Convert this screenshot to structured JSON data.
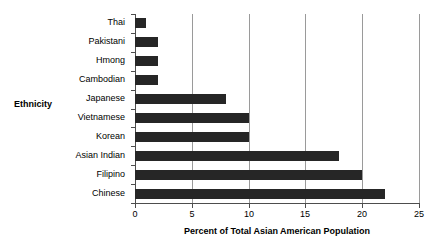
{
  "chart_data": {
    "type": "bar",
    "orientation": "horizontal",
    "title": "",
    "xlabel": "Percent of Total Asian American Population",
    "ylabel": "Ethnicity",
    "categories": [
      "Thai",
      "Pakistani",
      "Hmong",
      "Cambodian",
      "Japanese",
      "Vietnamese",
      "Korean",
      "Asian Indian",
      "Filipino",
      "Chinese"
    ],
    "values": [
      1,
      2,
      2,
      2,
      8,
      10,
      10,
      18,
      20,
      22
    ],
    "xlim": [
      0,
      25
    ],
    "xticks": [
      0,
      5,
      10,
      15,
      20,
      25
    ],
    "xticklabels": [
      "0",
      "5",
      "10",
      "15",
      "20",
      "25"
    ],
    "grid": "vertical",
    "legend": "none",
    "bar_color": "#262626",
    "gridline_color": "#9a9a9a",
    "axis_color": "#4d4d4d",
    "background_color": "#ffffff"
  }
}
